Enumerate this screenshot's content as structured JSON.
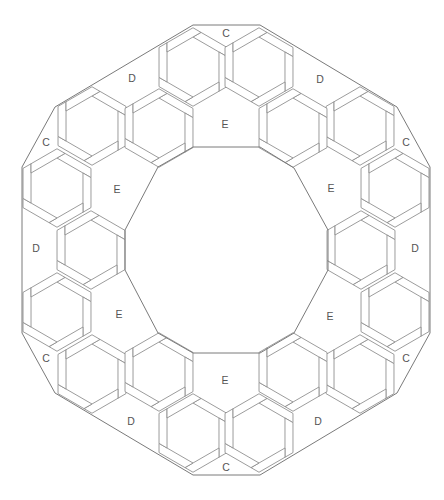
{
  "diagram": {
    "width": 444,
    "height": 500,
    "colors": {
      "background": "#ffffff",
      "line": "#8a8a8a",
      "boundary": "#7a7a7a",
      "label": "#555555"
    },
    "outer_boundary": [
      [
        193,
        25
      ],
      [
        260,
        25
      ],
      [
        397,
        107
      ],
      [
        430,
        167
      ],
      [
        430,
        333
      ],
      [
        397,
        393
      ],
      [
        260,
        475
      ],
      [
        193,
        475
      ],
      [
        55,
        393
      ],
      [
        22,
        333
      ],
      [
        22,
        167
      ],
      [
        55,
        107
      ]
    ],
    "inner_boundary": [
      [
        193,
        147
      ],
      [
        260,
        147
      ],
      [
        294,
        168
      ],
      [
        328,
        230
      ],
      [
        328,
        270
      ],
      [
        294,
        333
      ],
      [
        260,
        353
      ],
      [
        193,
        353
      ],
      [
        158,
        333
      ],
      [
        125,
        270
      ],
      [
        125,
        230
      ],
      [
        158,
        167
      ]
    ],
    "hex_inner_radius": 30,
    "hex_strip_width": 8,
    "hexagons": [
      {
        "ring": "outer",
        "cx": 193,
        "cy": 67
      },
      {
        "ring": "outer",
        "cx": 259,
        "cy": 67
      },
      {
        "ring": "outer",
        "cx": 92,
        "cy": 126
      },
      {
        "ring": "outer",
        "cx": 360,
        "cy": 126
      },
      {
        "ring": "outer",
        "cx": 57,
        "cy": 188
      },
      {
        "ring": "outer",
        "cx": 395,
        "cy": 188
      },
      {
        "ring": "outer",
        "cx": 57,
        "cy": 312
      },
      {
        "ring": "outer",
        "cx": 395,
        "cy": 312
      },
      {
        "ring": "outer",
        "cx": 92,
        "cy": 374
      },
      {
        "ring": "outer",
        "cx": 360,
        "cy": 374
      },
      {
        "ring": "outer",
        "cx": 193,
        "cy": 433
      },
      {
        "ring": "outer",
        "cx": 259,
        "cy": 433
      },
      {
        "ring": "inner",
        "cx": 159,
        "cy": 128
      },
      {
        "ring": "inner",
        "cx": 293,
        "cy": 128
      },
      {
        "ring": "inner",
        "cx": 91,
        "cy": 250
      },
      {
        "ring": "inner",
        "cx": 361,
        "cy": 250
      },
      {
        "ring": "inner",
        "cx": 159,
        "cy": 372
      },
      {
        "ring": "inner",
        "cx": 293,
        "cy": 372
      }
    ],
    "labels": [
      {
        "text": "C",
        "x": 226,
        "y": 33
      },
      {
        "text": "C",
        "x": 46,
        "y": 142
      },
      {
        "text": "C",
        "x": 406,
        "y": 142
      },
      {
        "text": "C",
        "x": 46,
        "y": 358
      },
      {
        "text": "C",
        "x": 406,
        "y": 358
      },
      {
        "text": "C",
        "x": 226,
        "y": 467
      },
      {
        "text": "D",
        "x": 132,
        "y": 78
      },
      {
        "text": "D",
        "x": 320,
        "y": 79
      },
      {
        "text": "D",
        "x": 36,
        "y": 248
      },
      {
        "text": "D",
        "x": 415,
        "y": 248
      },
      {
        "text": "D",
        "x": 131,
        "y": 421
      },
      {
        "text": "D",
        "x": 318,
        "y": 421
      },
      {
        "text": "E",
        "x": 225,
        "y": 124
      },
      {
        "text": "E",
        "x": 117,
        "y": 189
      },
      {
        "text": "E",
        "x": 331,
        "y": 188
      },
      {
        "text": "E",
        "x": 119,
        "y": 314
      },
      {
        "text": "E",
        "x": 330,
        "y": 316
      },
      {
        "text": "E",
        "x": 225,
        "y": 380
      }
    ]
  }
}
